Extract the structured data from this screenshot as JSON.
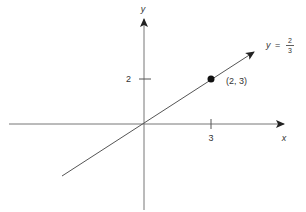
{
  "diagram": {
    "axes": {
      "x_label": "x",
      "y_label": "y"
    },
    "ticks": {
      "x_tick": "3",
      "y_tick": "2"
    },
    "point": {
      "label": "(2, 3)"
    },
    "line_label": {
      "lhs": "y",
      "eq": "=",
      "num": "2",
      "den": "3"
    },
    "colors": {
      "ink": "#333333",
      "line": "#555555"
    }
  }
}
